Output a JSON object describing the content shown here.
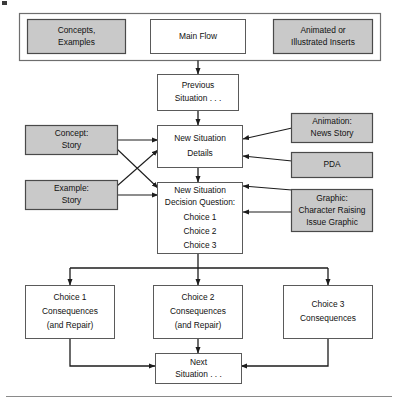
{
  "diagram": {
    "colors": {
      "legend_box_fill": "#c9c9c9",
      "flow_box_fill": "#ffffff",
      "border": "#5a5a5a",
      "connector": "#1c1c1c",
      "frame": "#6e6e6e"
    },
    "legend": {
      "name": "legend-panel",
      "items": [
        {
          "label_line1": "Concepts,",
          "label_line2": "Examples",
          "style": "gray"
        },
        {
          "label_line1": "Main Flow",
          "label_line2": "",
          "style": "white"
        },
        {
          "label_line1": "Animated or",
          "label_line2": "Illustrated Inserts",
          "style": "gray"
        }
      ]
    },
    "main_flow": [
      {
        "id": "previous-situation",
        "lines": [
          "Previous",
          "Situation . . ."
        ],
        "style": "white"
      },
      {
        "id": "new-situation-details",
        "lines": [
          "New Situation",
          "Details"
        ],
        "style": "white"
      },
      {
        "id": "new-situation-decision",
        "lines": [
          "New Situation",
          "Decision Question:",
          "Choice 1",
          "Choice 2",
          "Choice 3"
        ],
        "style": "white"
      },
      {
        "id": "next-situation",
        "lines": [
          "Next",
          "Situation . . ."
        ],
        "style": "white"
      }
    ],
    "left_inserts": [
      {
        "id": "concept-story",
        "lines": [
          "Concept:",
          "Story"
        ],
        "style": "gray"
      },
      {
        "id": "example-story",
        "lines": [
          "Example:",
          "Story"
        ],
        "style": "gray"
      }
    ],
    "right_inserts": [
      {
        "id": "animation-news-story",
        "lines": [
          "Animation:",
          "News Story"
        ],
        "style": "gray"
      },
      {
        "id": "pda",
        "lines": [
          "PDA"
        ],
        "style": "gray"
      },
      {
        "id": "character-raising-issue-graphic",
        "lines": [
          "Graphic:",
          "Character Raising",
          "Issue Graphic"
        ],
        "style": "gray"
      }
    ],
    "consequences": [
      {
        "id": "choice-1-consequences",
        "lines": [
          "Choice 1",
          "Consequences",
          "(and Repair)"
        ],
        "style": "white"
      },
      {
        "id": "choice-2-consequences",
        "lines": [
          "Choice 2",
          "Consequences",
          "(and Repair)"
        ],
        "style": "white"
      },
      {
        "id": "choice-3-consequences",
        "lines": [
          "Choice 3",
          "Consequences"
        ],
        "style": "white"
      }
    ]
  }
}
